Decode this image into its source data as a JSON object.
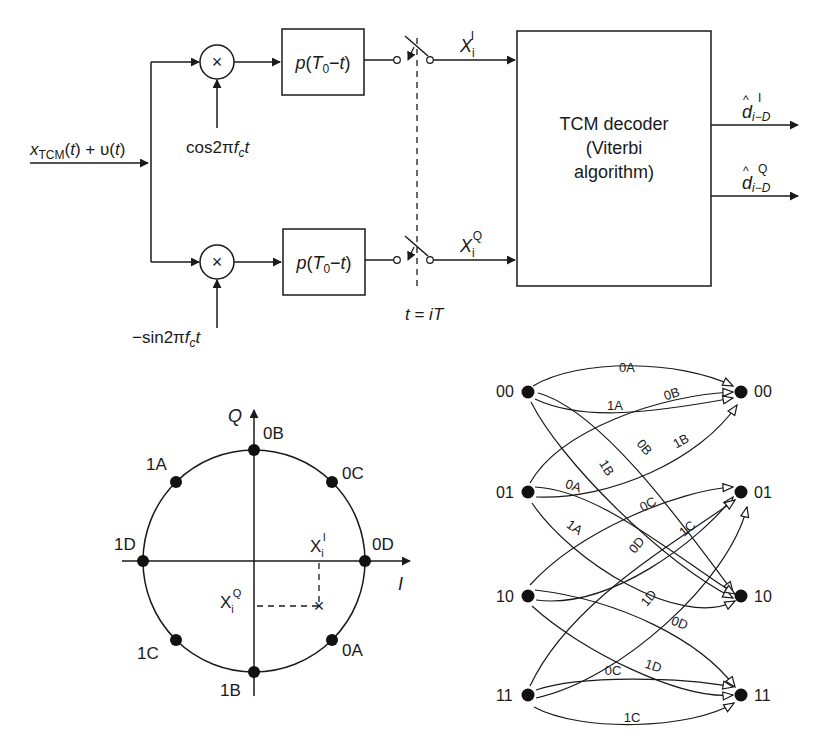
{
  "receiver": {
    "input_label": {
      "x": "x",
      "sub": "TCM",
      "rest1": "(",
      "t": "t",
      "rest2": ") + ",
      "upsilon": "υ",
      "rest3": "(",
      "t2": "t",
      "rest4": ")"
    },
    "mixer_symbol": "×",
    "upper_carrier": {
      "pre": "cos2π",
      "f": "f",
      "sub": "c",
      "t": "t"
    },
    "lower_carrier": {
      "pre": "−sin2π",
      "f": "f",
      "sub": "c",
      "t": "t"
    },
    "filter_label": {
      "p": "p",
      "open": "(",
      "T": "T",
      "sub": "0",
      "rest": "−",
      "t": "t",
      "close": ")"
    },
    "sample_label": {
      "t": "t",
      "eq": " = ",
      "i": "i",
      "T": "T"
    },
    "upper_output": {
      "X": "X",
      "sub": "i",
      "sup": "I"
    },
    "lower_output": {
      "X": "X",
      "sub": "i",
      "sup": "Q"
    },
    "decoder": {
      "line1": "TCM decoder",
      "line2": "(Viterbi",
      "line3": "algorithm)"
    },
    "outputs": [
      {
        "d": "d",
        "hat": "^",
        "sub": "i−D",
        "sup": "I"
      },
      {
        "d": "d",
        "hat": "^",
        "sub": "i−D",
        "sup": "Q"
      }
    ]
  },
  "constellation": {
    "axis_q": "Q",
    "axis_i": "I",
    "points": [
      {
        "label": "0D",
        "angle": 0
      },
      {
        "label": "0C",
        "angle": 45
      },
      {
        "label": "0B",
        "angle": 90
      },
      {
        "label": "1A",
        "angle": 135
      },
      {
        "label": "1D",
        "angle": 180
      },
      {
        "label": "1C",
        "angle": 225
      },
      {
        "label": "1B",
        "angle": 270
      },
      {
        "label": "0A",
        "angle": 315
      }
    ],
    "received_I": {
      "X": "X",
      "sub": "i",
      "sup": "I"
    },
    "received_Q": {
      "X": "X",
      "sub": "i",
      "sup": "Q"
    },
    "received_marker": "×"
  },
  "trellis": {
    "states_left": [
      "00",
      "01",
      "10",
      "11"
    ],
    "states_right": [
      "00",
      "01",
      "10",
      "11"
    ],
    "edges": [
      {
        "from": "00",
        "to": "00",
        "label": "0A"
      },
      {
        "from": "00",
        "to": "00",
        "label": "1A"
      },
      {
        "from": "00",
        "to": "10",
        "label": "0B"
      },
      {
        "from": "00",
        "to": "10",
        "label": "1B"
      },
      {
        "from": "01",
        "to": "00",
        "label": "0B"
      },
      {
        "from": "01",
        "to": "00",
        "label": "1B"
      },
      {
        "from": "01",
        "to": "10",
        "label": "0A"
      },
      {
        "from": "01",
        "to": "10",
        "label": "1A"
      },
      {
        "from": "10",
        "to": "01",
        "label": "0C"
      },
      {
        "from": "10",
        "to": "01",
        "label": "1C"
      },
      {
        "from": "10",
        "to": "11",
        "label": "0D"
      },
      {
        "from": "10",
        "to": "11",
        "label": "1D"
      },
      {
        "from": "11",
        "to": "01",
        "label": "0D"
      },
      {
        "from": "11",
        "to": "01",
        "label": "1D"
      },
      {
        "from": "11",
        "to": "11",
        "label": "0C"
      },
      {
        "from": "11",
        "to": "11",
        "label": "1C"
      }
    ]
  }
}
